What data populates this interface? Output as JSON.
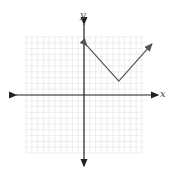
{
  "chart_data": {
    "type": "line",
    "title": "",
    "xlabel": "x",
    "ylabel": "y",
    "xlim": [
      -10,
      10
    ],
    "ylim": [
      -10,
      10
    ],
    "grid": true,
    "series": [
      {
        "name": "absolute value function",
        "points": [
          [
            0.5,
            8.5
          ],
          [
            6,
            2.4
          ],
          [
            11.7,
            8.8
          ]
        ]
      }
    ],
    "vertex": [
      6,
      2.4
    ]
  },
  "labels": {
    "x": "x",
    "y": "y"
  },
  "colors": {
    "grid": "#e2e2e2",
    "axis": "#222222",
    "curve": "#555555"
  }
}
